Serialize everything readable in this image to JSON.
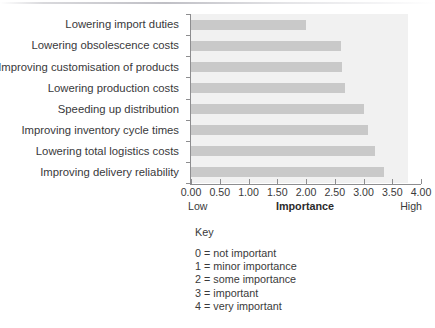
{
  "chart_data": {
    "type": "bar",
    "orientation": "horizontal",
    "title": "",
    "xlabel": "Importance",
    "ylabel": "",
    "xlim": [
      0,
      4
    ],
    "grid": false,
    "legend": "none",
    "categories": [
      "Lowering import duties",
      "Lowering obsolescence costs",
      "Improving customisation of products",
      "Lowering production costs",
      "Speeding up distribution",
      "Improving inventory cycle times",
      "Lowering total logistics costs",
      "Improving delivery reliability"
    ],
    "values": [
      2.0,
      2.6,
      2.62,
      2.68,
      3.0,
      3.08,
      3.2,
      3.35
    ],
    "xticks": [
      0,
      0.5,
      1,
      1.5,
      2,
      2.5,
      3,
      3.5,
      4
    ],
    "xtick_labels": [
      "0.00",
      "0.50",
      "1.00",
      "1.50",
      "2.00",
      "2.50",
      "3.00",
      "3.50",
      "4.00"
    ],
    "bar_color": "#c9c9c9",
    "plot_background": "#f1f1f1",
    "axis_color": "#8d8d8f"
  },
  "axis_caption": {
    "low": "Low",
    "title": "Importance",
    "high": "High"
  },
  "key": {
    "title": "Key",
    "items": [
      "0 = not important",
      "1 = minor importance",
      "2 = some importance",
      "3 = important",
      "4 = very important"
    ]
  }
}
